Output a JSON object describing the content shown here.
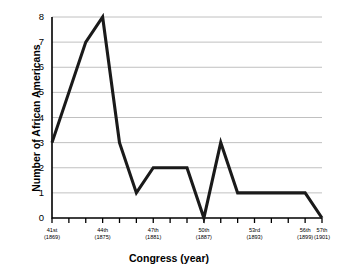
{
  "chart_data": {
    "type": "line",
    "title": "",
    "xlabel": "Congress (year)",
    "ylabel": "Number of African Americans",
    "ylim": [
      0,
      8
    ],
    "yticks": [
      0,
      1,
      2,
      3,
      4,
      5,
      6,
      7,
      8
    ],
    "grid": true,
    "legend": "none",
    "line_color": "#1a1a1a",
    "grid_color": "#b0b0b0",
    "axis_color": "#000000",
    "categories": [
      "41st",
      "42nd",
      "43rd",
      "44th",
      "45th",
      "46th",
      "47th",
      "48th",
      "49th",
      "50th",
      "51st",
      "52nd",
      "53rd",
      "54th",
      "55th",
      "56th",
      "57th"
    ],
    "years": [
      "1869",
      "1871",
      "1873",
      "1875",
      "1877",
      "1879",
      "1881",
      "1883",
      "1885",
      "1887",
      "1889",
      "1891",
      "1893",
      "1895",
      "1897",
      "1899",
      "1901"
    ],
    "values": [
      3,
      5,
      7,
      8,
      3,
      1,
      2,
      2,
      2,
      0,
      3,
      1,
      1,
      1,
      1,
      1,
      0
    ],
    "labeled_ticks": [
      {
        "index": 0,
        "congress": "41st",
        "year": "(1869)"
      },
      {
        "index": 3,
        "congress": "44th",
        "year": "(1875)"
      },
      {
        "index": 6,
        "congress": "47th",
        "year": "(1881)"
      },
      {
        "index": 9,
        "congress": "50th",
        "year": "(1887)"
      },
      {
        "index": 12,
        "congress": "53rd",
        "year": "(1893)"
      },
      {
        "index": 15,
        "congress": "56th",
        "year": "(1899)"
      },
      {
        "index": 16,
        "congress": "57th",
        "year": "(1901)"
      }
    ]
  }
}
